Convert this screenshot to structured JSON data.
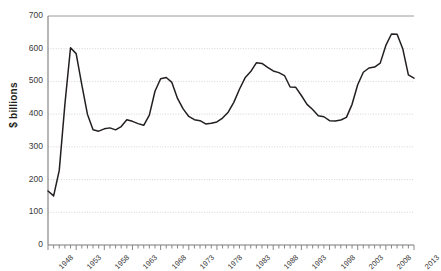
{
  "chart_data": {
    "type": "line",
    "title": "",
    "subtitle": "",
    "xlabel": "",
    "ylabel": "$ billions",
    "xlim": [
      1948,
      2013
    ],
    "ylim": [
      0,
      700
    ],
    "ytick_step": 100,
    "xtick_step": 1,
    "xlabel_step": 5,
    "grid": true,
    "grid_style": "dotted-horizontal",
    "legend": null,
    "legend_position": "none",
    "line_color": "#231f20",
    "grid_color": "#c9c9c9",
    "axis_color": "#7a7a7a",
    "ytick_labels": [
      "0",
      "100",
      "200",
      "300",
      "400",
      "500",
      "600",
      "700"
    ],
    "xtick_labels": [
      "1948",
      "1953",
      "1958",
      "1963",
      "1968",
      "1973",
      "1978",
      "1983",
      "1988",
      "1993",
      "1998",
      "2003",
      "2008",
      "2013"
    ],
    "x": [
      1948,
      1949,
      1950,
      1951,
      1952,
      1953,
      1954,
      1955,
      1956,
      1957,
      1958,
      1959,
      1960,
      1961,
      1962,
      1963,
      1964,
      1965,
      1966,
      1967,
      1968,
      1969,
      1970,
      1971,
      1972,
      1973,
      1974,
      1975,
      1976,
      1977,
      1978,
      1979,
      1980,
      1981,
      1982,
      1983,
      1984,
      1985,
      1986,
      1987,
      1988,
      1989,
      1990,
      1991,
      1992,
      1993,
      1994,
      1995,
      1996,
      1997,
      1998,
      1999,
      2000,
      2001,
      2002,
      2003,
      2004,
      2005,
      2006,
      2007,
      2008,
      2009,
      2010,
      2011,
      2012,
      2013
    ],
    "values": [
      165,
      150,
      228,
      430,
      603,
      585,
      490,
      400,
      352,
      348,
      355,
      358,
      352,
      362,
      383,
      378,
      371,
      366,
      397,
      470,
      508,
      512,
      497,
      448,
      416,
      393,
      383,
      380,
      370,
      372,
      376,
      388,
      406,
      436,
      476,
      511,
      530,
      557,
      555,
      543,
      532,
      527,
      518,
      483,
      482,
      457,
      430,
      414,
      395,
      392,
      380,
      379,
      382,
      390,
      430,
      490,
      528,
      541,
      544,
      556,
      610,
      645,
      644,
      600,
      520,
      510
    ],
    "annotations": [
      {
        "label": "Korean War peak",
        "x": 1952,
        "y": 603
      },
      {
        "label": "Vietnam War peak",
        "x": 1968,
        "y": 508
      },
      {
        "label": "Cold War buildup peak",
        "x": 1985,
        "y": 557
      },
      {
        "label": "Post-Cold-War trough",
        "x": 1999,
        "y": 379
      },
      {
        "label": "Iraq/Afghanistan peak",
        "x": 2010,
        "y": 645
      }
    ]
  }
}
